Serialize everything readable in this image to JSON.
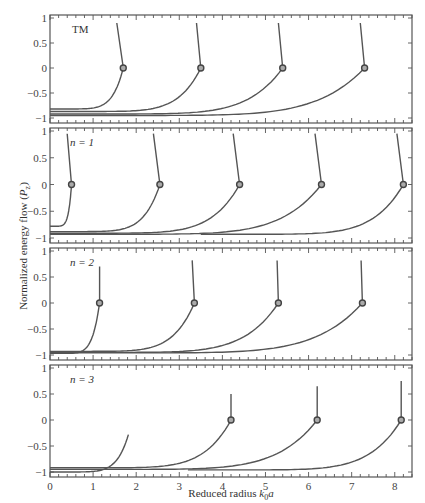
{
  "chart_data": {
    "type": "line",
    "xlabel": "Reduced radius k0a",
    "xlabel_parts": {
      "main": "Reduced radius ",
      "k": "k",
      "sub": "0",
      "a": "a"
    },
    "ylabel": "Normalized energy flow (Pz)",
    "ylabel_parts": {
      "main": "Normalized energy flow (",
      "P": "P",
      "sub": "z",
      "close": ")"
    },
    "xlim": [
      0,
      8.4
    ],
    "ylim": [
      -1,
      1
    ],
    "x_ticks": [
      0,
      1,
      2,
      3,
      4,
      5,
      6,
      7,
      8
    ],
    "x_tick_labels": [
      "0",
      "1",
      "2",
      "3",
      "4",
      "5",
      "6",
      "7",
      "8"
    ],
    "y_ticks": [
      -1,
      -0.5,
      0,
      0.5,
      1
    ],
    "y_tick_labels": [
      "−1",
      "−0.5",
      "0",
      "0.5",
      "1"
    ],
    "grid": false,
    "legend": null,
    "panels": [
      {
        "label": "TM",
        "marker_style": "filled-gray",
        "zero_crossings": [
          1.7,
          3.5,
          5.4,
          7.3
        ],
        "curves": [
          {
            "start_x": 0.0,
            "start_y": -0.82,
            "cross_x": 1.7,
            "end_x": 1.55,
            "end_y": 0.9
          },
          {
            "start_x": 0.0,
            "start_y": -0.87,
            "cross_x": 3.5,
            "end_x": 3.4,
            "end_y": 0.9
          },
          {
            "start_x": 0.0,
            "start_y": -0.92,
            "cross_x": 5.4,
            "end_x": 5.3,
            "end_y": 0.9
          },
          {
            "start_x": 0.0,
            "start_y": -0.95,
            "cross_x": 7.3,
            "end_x": 7.2,
            "end_y": 0.9
          }
        ]
      },
      {
        "label": "n = 1",
        "marker_style": "open-dark",
        "zero_crossings": [
          0.5,
          2.55,
          4.4,
          6.3,
          8.2
        ],
        "curves": [
          {
            "start_x": 0.0,
            "start_y": -0.78,
            "cross_x": 0.5,
            "end_x": 0.4,
            "end_y": 0.95
          },
          {
            "start_x": 0.0,
            "start_y": -0.88,
            "cross_x": 2.55,
            "end_x": 2.4,
            "end_y": 0.95
          },
          {
            "start_x": 0.0,
            "start_y": -0.91,
            "cross_x": 4.4,
            "end_x": 4.25,
            "end_y": 0.95
          },
          {
            "start_x": 0.0,
            "start_y": -0.93,
            "cross_x": 6.3,
            "end_x": 6.15,
            "end_y": 0.95
          },
          {
            "start_x": 3.5,
            "start_y": -0.93,
            "cross_x": 8.2,
            "end_x": 8.05,
            "end_y": 0.95
          }
        ]
      },
      {
        "label": "n = 2",
        "marker_style": "open-dark",
        "zero_crossings": [
          1.15,
          3.35,
          5.3,
          7.25
        ],
        "curves": [
          {
            "start_x": 0.0,
            "start_y": -0.97,
            "cross_x": 1.15,
            "end_x": 1.15,
            "end_y": 0.7
          },
          {
            "start_x": 0.0,
            "start_y": -0.93,
            "cross_x": 3.35,
            "end_x": 3.3,
            "end_y": 0.82
          },
          {
            "start_x": 0.0,
            "start_y": -0.95,
            "cross_x": 5.3,
            "end_x": 5.27,
            "end_y": 0.82
          },
          {
            "start_x": 0.0,
            "start_y": -0.96,
            "cross_x": 7.25,
            "end_x": 7.22,
            "end_y": 0.82
          }
        ]
      },
      {
        "label": "n = 3",
        "marker_style": "open-dark",
        "zero_crossings": [
          4.2,
          6.2,
          8.15
        ],
        "curves": [
          {
            "start_x": 0.0,
            "start_y": -1.0,
            "cross_x": null,
            "end_x": 1.82,
            "end_y": -0.28
          },
          {
            "start_x": 0.0,
            "start_y": -0.92,
            "cross_x": 4.2,
            "end_x": 4.2,
            "end_y": 0.5
          },
          {
            "start_x": 0.0,
            "start_y": -0.95,
            "cross_x": 6.2,
            "end_x": 6.2,
            "end_y": 0.65
          },
          {
            "start_x": 3.2,
            "start_y": -0.96,
            "cross_x": 8.15,
            "end_x": 8.15,
            "end_y": 0.75
          }
        ]
      }
    ]
  },
  "colors": {
    "line": "#555555",
    "frame": "#555555",
    "marker_fill_tm": "#aaaaaa",
    "marker_fill_other": "#bbbbbb",
    "marker_stroke": "#444444"
  }
}
